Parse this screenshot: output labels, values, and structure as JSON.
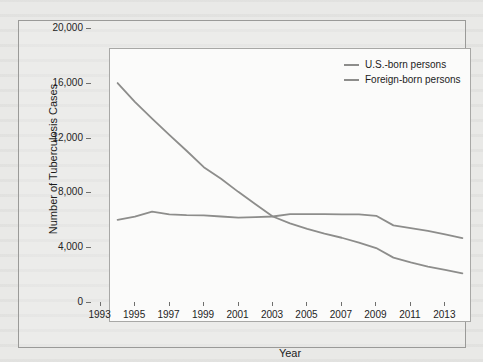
{
  "figure": {
    "background_color": "#e9e9e7",
    "plot_background_color": "#fbfbfa",
    "frame_color": "#9a9a98"
  },
  "axes": {
    "xlabel": "Year",
    "ylabel": "Number of Tuberculosis Cases",
    "yticks": [
      "0",
      "4,000",
      "8,000",
      "12,000",
      "16,000",
      "20,000"
    ],
    "ytick_values": [
      0,
      4000,
      8000,
      12000,
      16000,
      20000
    ],
    "xticks": [
      "1993",
      "1995",
      "1997",
      "1999",
      "2001",
      "2003",
      "2005",
      "2007",
      "2009",
      "2011",
      "2013"
    ],
    "xtick_values": [
      1993,
      1995,
      1997,
      1999,
      2001,
      2003,
      2005,
      2007,
      2009,
      2011,
      2013
    ]
  },
  "legend": {
    "position": "top-right",
    "entries": [
      {
        "label": "U.S.-born persons",
        "color": "#8d8d8b"
      },
      {
        "label": "Foreign-born persons",
        "color": "#8d8d8b"
      }
    ]
  },
  "chart_data": {
    "type": "line",
    "title": "",
    "subtitle": "",
    "xlabel": "Year",
    "ylabel": "Number of Tuberculosis Cases",
    "xlim": [
      1992.5,
      2013.5
    ],
    "ylim": [
      0,
      20000
    ],
    "grid": false,
    "legend_position": "top-right",
    "x": [
      1993,
      1994,
      1995,
      1996,
      1997,
      1998,
      1999,
      2000,
      2001,
      2002,
      2003,
      2004,
      2005,
      2006,
      2007,
      2008,
      2009,
      2010,
      2011,
      2012,
      2013
    ],
    "series": [
      {
        "name": "U.S.-born persons",
        "color": "#8d8d8b",
        "values": [
          17440,
          16070,
          14840,
          13660,
          12500,
          11300,
          10450,
          9500,
          8600,
          7700,
          7200,
          6800,
          6450,
          6150,
          5800,
          5400,
          4700,
          4350,
          4050,
          3800,
          3550
        ]
      },
      {
        "name": "Foreign-born persons",
        "color": "#8d8d8b",
        "values": [
          7450,
          7700,
          8060,
          7860,
          7800,
          7780,
          7700,
          7620,
          7650,
          7700,
          7880,
          7870,
          7880,
          7850,
          7850,
          7750,
          7050,
          6850,
          6650,
          6400,
          6130
        ]
      }
    ]
  }
}
